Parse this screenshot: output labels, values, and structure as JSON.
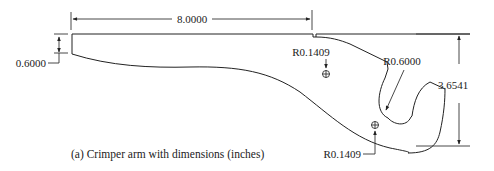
{
  "figure": {
    "caption": "(a) Crimper arm with dimensions (inches)",
    "dimensions": {
      "overall_length": "8.0000",
      "thickness_left": "0.6000",
      "overall_height": "3.6541",
      "hook_radius": "R0.6000",
      "upper_fillet_radius": "R0.1409",
      "lower_fillet_radius": "R0.1409"
    },
    "colors": {
      "line": "#222222",
      "background": "#ffffff"
    }
  }
}
